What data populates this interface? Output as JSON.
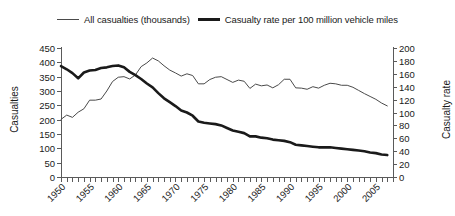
{
  "legend": {
    "entries": [
      {
        "label": "All casualties (thousands)",
        "style": "thin",
        "color": "#4a4a4a"
      },
      {
        "label": "Casualty rate per 100 million vehicle miles",
        "style": "thick",
        "color": "#1a1a1a"
      }
    ]
  },
  "axes": {
    "left_title": "Casualties",
    "right_title": "Casualty rate"
  },
  "chart_data": {
    "type": "line",
    "title": "",
    "subtitle": "",
    "xlabel": "",
    "ylabel": "Casualties",
    "y2label": "Casualty rate",
    "grid": false,
    "legend_position": "top",
    "xlim": [
      1950,
      2008
    ],
    "ylim": [
      0,
      450
    ],
    "y2lim": [
      0,
      200
    ],
    "y_ticks": [
      0,
      50,
      100,
      150,
      200,
      250,
      300,
      350,
      400,
      450
    ],
    "y2_ticks": [
      0,
      20,
      40,
      60,
      80,
      100,
      120,
      140,
      160,
      180,
      200
    ],
    "x_tick_labels": [
      "1950",
      "1955",
      "1960",
      "1965",
      "1970",
      "1975",
      "1980",
      "1985",
      "1990",
      "1995",
      "2000",
      "2005"
    ],
    "x_tick_label_values": [
      1950,
      1955,
      1960,
      1965,
      1970,
      1975,
      1980,
      1985,
      1990,
      1995,
      2000,
      2005
    ],
    "x_minor_tick_step": 1,
    "x": [
      1950,
      1951,
      1952,
      1953,
      1954,
      1955,
      1956,
      1957,
      1958,
      1959,
      1960,
      1961,
      1962,
      1963,
      1964,
      1965,
      1966,
      1967,
      1968,
      1969,
      1970,
      1971,
      1972,
      1973,
      1974,
      1975,
      1976,
      1977,
      1978,
      1979,
      1980,
      1981,
      1982,
      1983,
      1984,
      1985,
      1986,
      1987,
      1988,
      1989,
      1990,
      1991,
      1992,
      1993,
      1994,
      1995,
      1996,
      1997,
      1998,
      1999,
      2000,
      2001,
      2002,
      2003,
      2004,
      2005,
      2006,
      2007
    ],
    "series": [
      {
        "name": "All casualties (thousands)",
        "axis": "left",
        "style": "thin",
        "color": "#4a4a4a",
        "values": [
          201,
          216,
          208,
          226,
          238,
          268,
          268,
          272,
          300,
          333,
          348,
          350,
          342,
          356,
          385,
          398,
          415,
          405,
          388,
          373,
          363,
          352,
          360,
          354,
          325,
          325,
          340,
          348,
          350,
          340,
          330,
          338,
          334,
          309,
          324,
          318,
          321,
          311,
          322,
          341,
          341,
          311,
          310,
          306,
          315,
          310,
          320,
          327,
          325,
          320,
          320,
          313,
          302,
          291,
          281,
          271,
          258,
          248
        ]
      },
      {
        "name": "Casualty rate per 100 million vehicle miles",
        "axis": "right",
        "style": "thick",
        "color": "#1a1a1a",
        "values": [
          172,
          167,
          161,
          153,
          162,
          165,
          166,
          169,
          170,
          172,
          173,
          170,
          163,
          158,
          152,
          145,
          139,
          130,
          122,
          116,
          110,
          103,
          100,
          95,
          86,
          84,
          83,
          82,
          80,
          76,
          72,
          70,
          68,
          63,
          63,
          61,
          60,
          58,
          57,
          56,
          54,
          50,
          49,
          48,
          47,
          46,
          46,
          46,
          45,
          44,
          43,
          42,
          41,
          40,
          38,
          37,
          35,
          34
        ]
      }
    ]
  }
}
